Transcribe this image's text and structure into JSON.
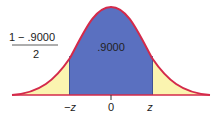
{
  "diagram": {
    "type": "normal-distribution",
    "center_area_label": ".9000",
    "tail_fraction": {
      "numerator": "1 − .9000",
      "denominator": "2"
    },
    "axis_labels": {
      "left": "−z",
      "center": "0",
      "right": "z"
    },
    "colors": {
      "curve": "#d42a4a",
      "center_fill": "#5a70c0",
      "tail_fill": "#fbf4b0",
      "axis": "#333333"
    }
  }
}
